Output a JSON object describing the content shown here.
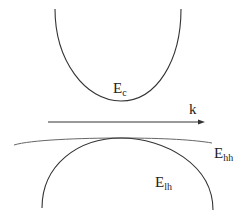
{
  "diagram": {
    "type": "band-structure",
    "axis": {
      "label": "k",
      "direction": "right"
    },
    "bands": [
      {
        "id": "conduction",
        "label_main": "E",
        "label_sub": "c",
        "shape": "parabola-up"
      },
      {
        "id": "heavy-hole",
        "label_main": "E",
        "label_sub": "hh",
        "shape": "flat-parabola-down"
      },
      {
        "id": "light-hole",
        "label_main": "E",
        "label_sub": "lh",
        "shape": "parabola-down"
      }
    ],
    "colors": {
      "curve": "#333333",
      "heavy_hole_curve": "#666666",
      "background": "#ffffff"
    }
  }
}
